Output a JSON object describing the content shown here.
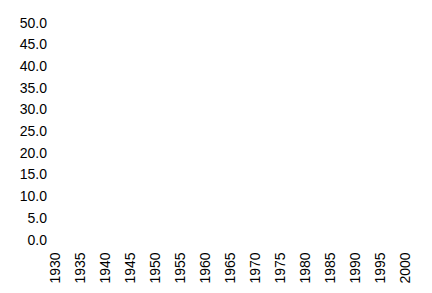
{
  "chart_data": {
    "type": "line",
    "title": "",
    "xlabel": "",
    "ylabel": "",
    "x_tick_labels": [
      "1930",
      "1935",
      "1940",
      "1945",
      "1950",
      "1955",
      "1960",
      "1965",
      "1970",
      "1975",
      "1980",
      "1985",
      "1990",
      "1995",
      "2000"
    ],
    "y_tick_labels": [
      "50.0",
      "45.0",
      "40.0",
      "35.0",
      "30.0",
      "25.0",
      "20.0",
      "15.0",
      "10.0",
      "5.0",
      "0.0"
    ],
    "xlim": [
      1930,
      2000
    ],
    "ylim": [
      0.0,
      50.0
    ],
    "x_tick_step": 5,
    "y_tick_step": 5.0,
    "grid": false,
    "axis_lines_visible": false,
    "series": [],
    "plot_area_content": "empty — no data series, gridlines, tick marks, or axis lines rendered",
    "text_color": "#000000",
    "background_color": "#ffffff"
  }
}
